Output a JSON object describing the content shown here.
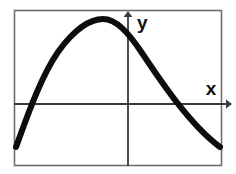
{
  "figure": {
    "background_color": "#ffffff",
    "frame": {
      "name": "plot-border",
      "color": "#6e6e6e",
      "x": 14,
      "y": 10,
      "width": 208,
      "height": 156
    }
  },
  "axes": {
    "x_axis": {
      "label": "x",
      "label_x": 211,
      "label_y": 95,
      "line_y": 104,
      "line_x_start": 14,
      "line_x_end": 231,
      "arrow": "right-arrow",
      "color": "#3a3a3a"
    },
    "y_axis": {
      "label": "y",
      "label_x": 137,
      "label_y": 29,
      "line_x": 128,
      "line_y_start": 11,
      "line_y_end": 166,
      "arrow": "up-arrow",
      "color": "#3a3a3a"
    },
    "origin": {
      "x": 128,
      "y": 104
    }
  },
  "chart_data": {
    "type": "line",
    "title": "",
    "xlabel": "x",
    "ylabel": "y",
    "grid": false,
    "legend": null,
    "curve_name": "parabola",
    "curve_color": "#0d0d0d",
    "curve_width": 6,
    "vertex": {
      "x": -26,
      "y": 85
    },
    "x_intercepts": [
      -95,
      64
    ],
    "axis_ranges": {
      "xlim": [
        -114,
        94
      ],
      "ylim": [
        -62,
        94
      ]
    },
    "pixel_path": "M 16,147 C 26,120 40,78 58,52 C 76,27 92,19 103,19 C 116,19 128,32 142,53 C 160,80 190,125 220,147",
    "points": [
      {
        "x": -114,
        "y": -43
      },
      {
        "x": -95,
        "y": 0
      },
      {
        "x": -70,
        "y": 52
      },
      {
        "x": -45,
        "y": 78
      },
      {
        "x": -26,
        "y": 85
      },
      {
        "x": 0,
        "y": 73
      },
      {
        "x": 30,
        "y": 40
      },
      {
        "x": 64,
        "y": 0
      },
      {
        "x": 92,
        "y": -43
      }
    ]
  }
}
